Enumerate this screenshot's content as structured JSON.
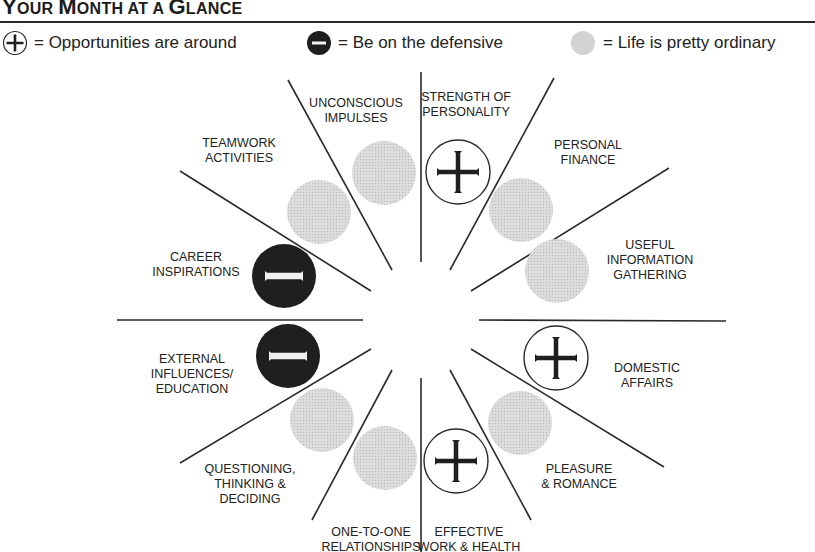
{
  "title": {
    "parts": [
      {
        "big": "Y",
        "small": "OUR "
      },
      {
        "big": "M",
        "small": "ONTH "
      },
      {
        "big": "",
        "small": "AT A "
      },
      {
        "big": "G",
        "small": "LANCE"
      }
    ],
    "text": "Your Month at a Glance"
  },
  "legend": [
    {
      "icon": "plus-circle-icon",
      "label": "= Opportunities are around",
      "meaning": "opportunity"
    },
    {
      "icon": "minus-circle-icon",
      "label": "= Be on the defensive",
      "meaning": "defensive"
    },
    {
      "icon": "gray-circle-icon",
      "label": "= Life is pretty ordinary",
      "meaning": "ordinary"
    }
  ],
  "colors": {
    "line": "#2a2a2a",
    "dark": "#1f1f1f",
    "gray": "#d3d3d3",
    "text": "#222222"
  },
  "wheel": {
    "center": [
      421,
      320
    ],
    "sectors": [
      {
        "name": "strength-of-personality",
        "lines": [
          "STRENGTH OF",
          "PERSONALITY"
        ],
        "status": "opportunity",
        "label_pos": [
          466,
          90
        ],
        "icon_pos": [
          458,
          172
        ]
      },
      {
        "name": "personal-finance",
        "lines": [
          "PERSONAL",
          "FINANCE"
        ],
        "status": "ordinary",
        "label_pos": [
          588,
          138
        ],
        "icon_pos": [
          521,
          210
        ]
      },
      {
        "name": "useful-information-gathering",
        "lines": [
          "USEFUL",
          "INFORMATION",
          "GATHERING"
        ],
        "status": "ordinary",
        "label_pos": [
          650,
          238
        ],
        "icon_pos": [
          557,
          271
        ]
      },
      {
        "name": "domestic-affairs",
        "lines": [
          "DOMESTIC",
          "AFFAIRS"
        ],
        "status": "opportunity",
        "label_pos": [
          647,
          361
        ],
        "icon_pos": [
          556,
          358
        ]
      },
      {
        "name": "pleasure-romance",
        "lines": [
          "PLEASURE",
          "& ROMANCE"
        ],
        "status": "ordinary",
        "label_pos": [
          579,
          462
        ],
        "icon_pos": [
          520,
          423
        ]
      },
      {
        "name": "effective-work-health",
        "lines": [
          "EFFECTIVE",
          "WORK & HEALTH"
        ],
        "status": "opportunity",
        "label_pos": [
          469,
          525
        ],
        "icon_pos": [
          456,
          461
        ]
      },
      {
        "name": "one-to-one-relationships",
        "lines": [
          "ONE-TO-ONE",
          "RELATIONSHIPS"
        ],
        "status": "ordinary",
        "label_pos": [
          371,
          525
        ],
        "icon_pos": [
          385,
          458
        ]
      },
      {
        "name": "questioning-thinking-deciding",
        "lines": [
          "QUESTIONING,",
          "THINKING &",
          "DECIDING"
        ],
        "status": "ordinary",
        "label_pos": [
          250,
          462
        ],
        "icon_pos": [
          322,
          420
        ]
      },
      {
        "name": "external-influences-education",
        "lines": [
          "EXTERNAL",
          "INFLUENCES/",
          "EDUCATION"
        ],
        "status": "defensive",
        "label_pos": [
          192,
          352
        ],
        "icon_pos": [
          288,
          356
        ]
      },
      {
        "name": "career-inspirations",
        "lines": [
          "CAREER",
          "INSPIRATIONS"
        ],
        "status": "defensive",
        "label_pos": [
          196,
          250
        ],
        "icon_pos": [
          284,
          276
        ]
      },
      {
        "name": "teamwork-activities",
        "lines": [
          "TEAMWORK",
          "ACTIVITIES"
        ],
        "status": "ordinary",
        "label_pos": [
          239,
          136
        ],
        "icon_pos": [
          319,
          212
        ]
      },
      {
        "name": "unconscious-impulses",
        "lines": [
          "UNCONSCIOUS",
          "IMPULSES"
        ],
        "status": "ordinary",
        "label_pos": [
          356,
          96
        ],
        "icon_pos": [
          384,
          173
        ]
      }
    ],
    "spokes": [
      [
        421,
        262,
        421,
        72
      ],
      [
        450,
        270,
        554,
        78
      ],
      [
        471,
        291,
        669,
        168
      ],
      [
        479,
        320,
        726,
        321
      ],
      [
        471,
        349,
        664,
        467
      ],
      [
        450,
        370,
        531,
        520
      ],
      [
        421,
        378,
        421,
        552
      ],
      [
        392,
        370,
        312,
        520
      ],
      [
        371,
        349,
        180,
        463
      ],
      [
        363,
        320,
        117,
        320
      ],
      [
        371,
        291,
        180,
        171
      ],
      [
        392,
        270,
        288,
        80
      ]
    ],
    "icon_radius": 32
  }
}
